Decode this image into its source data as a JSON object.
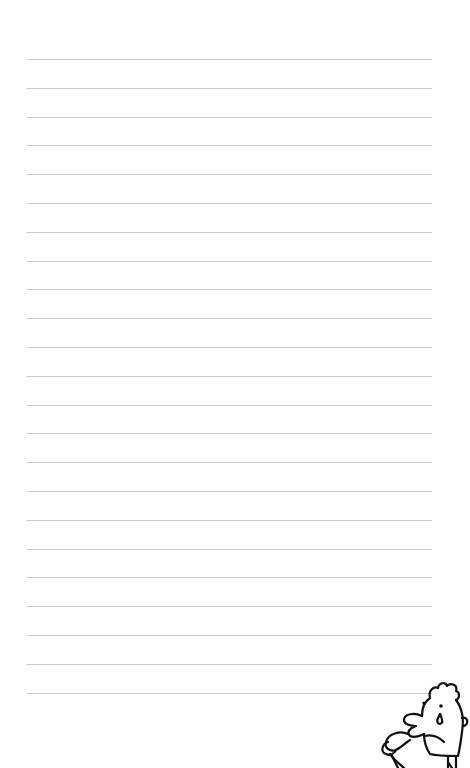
{
  "page": {
    "type": "lined-notebook-page",
    "background_color": "#fefefe",
    "rule_color": "#c9c9c9",
    "rule_count": 23,
    "rule_start_y": 59,
    "rule_spacing": 28.8,
    "rule_left": 27,
    "rule_right": 432
  },
  "decoration": {
    "character": "crying-cartoon-man-icon"
  }
}
